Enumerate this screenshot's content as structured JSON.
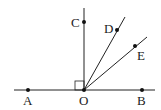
{
  "diagram": {
    "points": {
      "A": {
        "label": "A",
        "x": 28,
        "y": 90
      },
      "O": {
        "label": "O",
        "x": 84,
        "y": 90
      },
      "B": {
        "label": "B",
        "x": 142,
        "y": 90
      },
      "C": {
        "label": "C",
        "x": 84,
        "y": 22
      },
      "D": {
        "label": "D",
        "x": 117,
        "y": 30
      },
      "E": {
        "label": "E",
        "x": 135,
        "y": 46
      }
    },
    "right_angle_marker": "angle COA",
    "colors": {
      "line": "#222222",
      "background": "#ffffff"
    }
  }
}
